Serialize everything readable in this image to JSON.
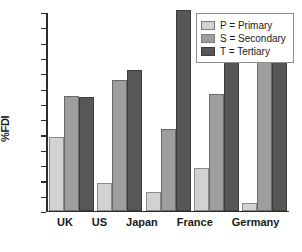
{
  "chart_data": {
    "type": "bar",
    "title": "",
    "xlabel": "",
    "ylabel": "%FDI",
    "ylim": [
      0,
      65
    ],
    "ytick_step": 5,
    "grid": false,
    "legend_position": "top-right",
    "categories": [
      "UK",
      "US",
      "Japan",
      "France",
      "Germany"
    ],
    "series": [
      {
        "name": "P = Primary",
        "key": "P",
        "color": "#d2d2d2",
        "values": [
          24,
          9,
          6,
          14,
          2.5
        ]
      },
      {
        "name": "S = Secondary",
        "key": "S",
        "color": "#9e9e9e",
        "values": [
          37.5,
          42.5,
          26.5,
          38,
          48.5
        ]
      },
      {
        "name": "T = Tertiary",
        "key": "T",
        "color": "#575757",
        "values": [
          37,
          46,
          65.5,
          48.5,
          48.5
        ]
      }
    ],
    "yticks": [
      "0",
      "5",
      "10",
      "15",
      "20",
      "25",
      "30",
      "35",
      "40",
      "45",
      "50",
      "55",
      "60",
      "65"
    ]
  },
  "legend": {
    "items": [
      {
        "label": "P = Primary"
      },
      {
        "label": "S = Secondary"
      },
      {
        "label": "T = Tertiary"
      }
    ]
  }
}
